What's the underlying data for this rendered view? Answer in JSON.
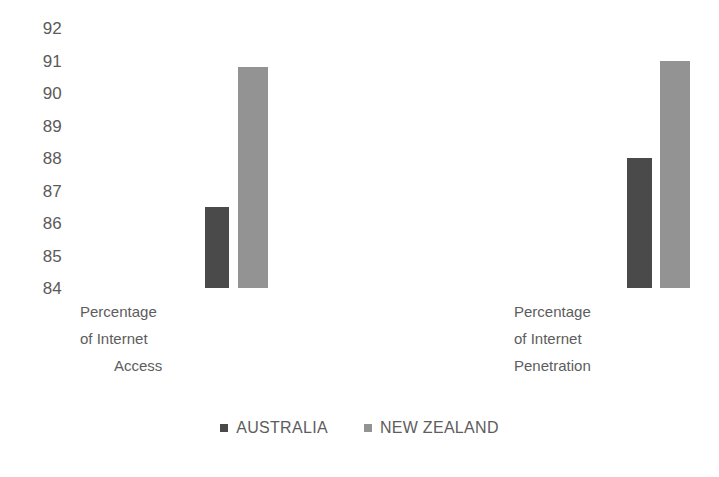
{
  "chart_data": {
    "type": "bar",
    "title": "",
    "subtitle": "",
    "xlabel": "",
    "ylabel": "",
    "categories": [
      "Percentage of Internet Access",
      "Percentage of Internet Penetration"
    ],
    "category_lines": [
      [
        "Percentage",
        "of Internet",
        "Access"
      ],
      [
        "Percentage",
        "of Internet",
        "Penetration"
      ]
    ],
    "series": [
      {
        "name": "AUSTRALIA",
        "color": "#4a4a4a",
        "values": [
          86.5,
          88.0
        ]
      },
      {
        "name": "NEW ZEALAND",
        "color": "#939393",
        "values": [
          90.8,
          91.0
        ]
      }
    ],
    "ylim": [
      84,
      92
    ],
    "yticks": [
      92,
      91,
      90,
      89,
      88,
      87,
      86,
      85,
      84
    ],
    "ytick_labels": [
      "92",
      "91",
      "90",
      "89",
      "88",
      "87",
      "86",
      "85",
      "84"
    ],
    "grid": false,
    "legend_position": "bottom",
    "legend_marker": "square"
  },
  "legend": {
    "items": [
      {
        "label": "AUSTRALIA",
        "color": "#4a4a4a"
      },
      {
        "label": "NEW ZEALAND",
        "color": "#939393"
      }
    ]
  },
  "colors": {
    "australia": "#4a4a4a",
    "new_zealand": "#939393",
    "text": "#5a5a5a",
    "background": "#ffffff"
  }
}
